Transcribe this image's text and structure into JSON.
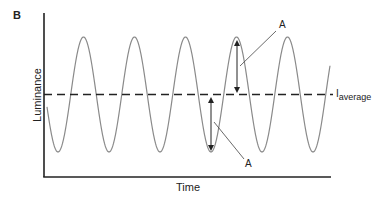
{
  "chart_data": {
    "type": "line",
    "panel_label": "B",
    "title": "",
    "xlabel": "Time",
    "ylabel": "Luminance",
    "grid": false,
    "series": [
      {
        "name": "luminance-waveform",
        "shape": "sinusoid",
        "cycles_shown": 5.5,
        "color": "#8a8a8a",
        "style": "solid"
      },
      {
        "name": "I_average",
        "shape": "constant",
        "color": "#222222",
        "style": "dashed"
      }
    ],
    "annotations": [
      {
        "label": "A",
        "meaning": "amplitude from I_average to trough",
        "arrow": "double-headed"
      },
      {
        "label": "A",
        "meaning": "amplitude from I_average to peak",
        "arrow": "double-headed"
      }
    ],
    "average_label": {
      "main": "I",
      "subscript": "average"
    }
  },
  "figure": {
    "panel_label": "B",
    "xlabel": "Time",
    "ylabel": "Luminance",
    "annotation_lower": "A",
    "annotation_upper": "A",
    "avg_main": "I",
    "avg_sub": "average",
    "colors": {
      "axis": "#222222",
      "wave": "#8a8a8a",
      "dashed": "#222222"
    }
  }
}
